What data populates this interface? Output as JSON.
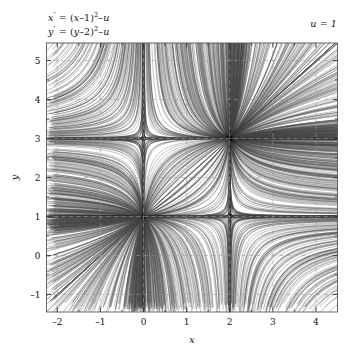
{
  "figure": {
    "type": "phase-portrait",
    "equation_1": {
      "lhs": "x′",
      "rhs_pre": " = (x–1)",
      "exponent": "2",
      "rhs_post": "–u",
      "full": "x′ = (x–1)²–u"
    },
    "equation_2": {
      "lhs": "y′",
      "rhs_pre": " = (y–2)",
      "exponent": "2",
      "rhs_post": "–u",
      "full": "y′ = (y–2)²–u"
    },
    "parameter_label": "u = 1",
    "parameter_name": "u",
    "parameter_value": 1
  },
  "chart_data": {
    "type": "line",
    "title": "",
    "subtitle": "",
    "xlabel": "x",
    "ylabel": "y",
    "xlim": [
      -2.25,
      4.5
    ],
    "ylim": [
      -1.45,
      5.45
    ],
    "xticks": [
      -2,
      -1,
      0,
      1,
      2,
      3,
      4
    ],
    "yticks": [
      -1,
      0,
      1,
      2,
      3,
      4,
      5
    ],
    "xticklabels": [
      "–2",
      "–1",
      "0",
      "1",
      "2",
      "3",
      "4"
    ],
    "yticklabels": [
      "–1",
      "0",
      "1",
      "2",
      "3",
      "4",
      "5"
    ],
    "xminorticks": [
      -1.5,
      -0.5,
      0.5,
      1.5,
      2.5,
      3.5
    ],
    "yminorticks": [
      -0.5,
      0.5,
      1.5,
      2.5,
      3.5,
      4.5
    ],
    "grid": true,
    "grid_style": "dashed",
    "grid_color": "#9a9a9a",
    "legend": null,
    "legend_position": "none",
    "frame": true,
    "frame_color": "#555555",
    "trajectory_color": "#4a4a4a",
    "trajectory_width": 0.55,
    "system": {
      "xdot": "(x-1)^2 - u",
      "ydot": "(y-2)^2 - u",
      "u": 1,
      "x_fixed_points": [
        0,
        2
      ],
      "y_fixed_points": [
        1,
        3
      ],
      "x_nullclines": [
        0,
        2
      ],
      "y_nullclines": [
        1,
        3
      ]
    },
    "equilibria": [
      {
        "x": 0,
        "y": 1,
        "type": "stable node"
      },
      {
        "x": 2,
        "y": 1,
        "type": "saddle"
      },
      {
        "x": 0,
        "y": 3,
        "type": "saddle"
      },
      {
        "x": 2,
        "y": 3,
        "type": "unstable node"
      }
    ],
    "seed_count": 150
  },
  "axes": {
    "x_axis_title": "x",
    "y_axis_title": "y"
  }
}
